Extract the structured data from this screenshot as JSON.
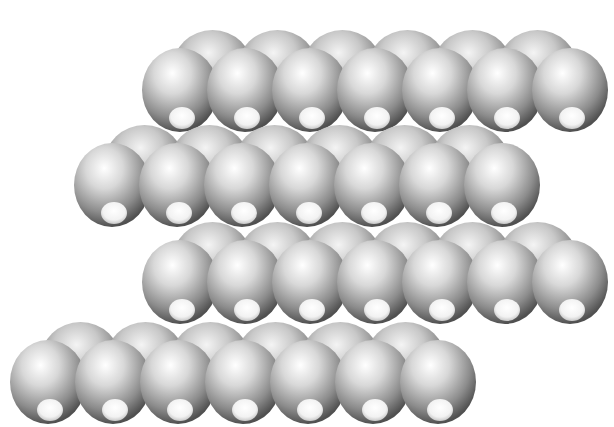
{
  "image": {
    "description": "Space-filling (CPK) model of four stacked zig-zag hydrocarbon chains, rendered in grayscale",
    "background_color": "#ffffff",
    "rows": [
      {
        "name": "chain-1",
        "start_x": 180,
        "y": 90,
        "atoms": 7,
        "spacing": 65
      },
      {
        "name": "chain-2",
        "start_x": 112,
        "y": 185,
        "atoms": 7,
        "spacing": 65
      },
      {
        "name": "chain-3",
        "start_x": 180,
        "y": 282,
        "atoms": 7,
        "spacing": 65
      },
      {
        "name": "chain-4",
        "start_x": 48,
        "y": 382,
        "atoms": 7,
        "spacing": 65
      }
    ]
  }
}
